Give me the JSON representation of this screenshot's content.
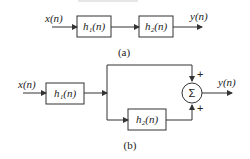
{
  "diagram_a": {
    "input": "x(n)",
    "block1": "h₁(n)",
    "block2": "h₂(n)",
    "output": "y(n)",
    "caption": "(a)"
  },
  "diagram_b": {
    "input": "x(n)",
    "block1": "h₁(n)",
    "block2": "h₂(n)",
    "summer": "Σ",
    "plus_top": "+",
    "plus_bottom": "+",
    "output": "y(n)",
    "caption": "(b)"
  },
  "colors": {
    "stroke": "#333333",
    "background": "#ffffff"
  }
}
